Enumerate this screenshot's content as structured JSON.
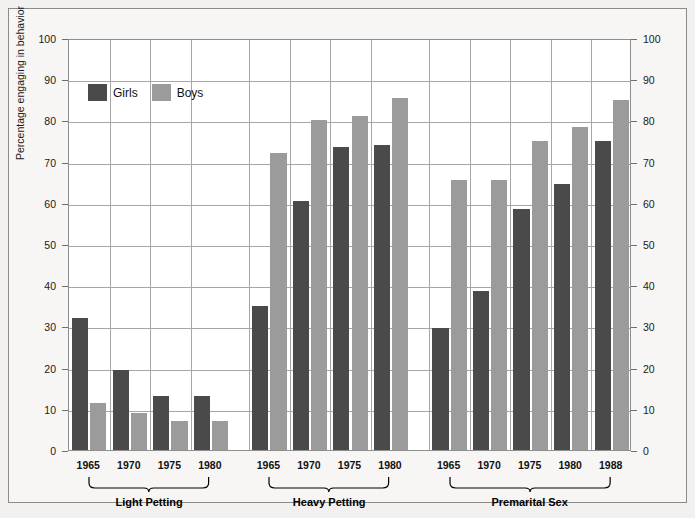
{
  "chart_data": {
    "type": "bar",
    "title": "",
    "subtitle": "",
    "xlabel": "",
    "ylabel": "Percentage engaging in behavior",
    "ylim": [
      0,
      100
    ],
    "ytick_values": [
      0,
      10,
      20,
      30,
      40,
      50,
      60,
      70,
      80,
      90,
      100
    ],
    "ytick_labels": [
      "0",
      "10",
      "20",
      "30",
      "40",
      "50",
      "60",
      "70",
      "80",
      "90",
      "100"
    ],
    "right_axis": true,
    "right_ytick_labels": [
      "0",
      "10",
      "20",
      "30",
      "40",
      "50",
      "60",
      "70",
      "80",
      "90",
      "100"
    ],
    "grid": true,
    "legend_position": "upper-left-inside",
    "legend": [
      {
        "name": "Girls",
        "color": "#4a4a4a"
      },
      {
        "name": "Boys",
        "color": "#9b9b9b"
      }
    ],
    "groups": [
      {
        "label": "Light Petting",
        "categories": [
          "1965",
          "1970",
          "1975",
          "1980"
        ],
        "series": [
          {
            "name": "Girls",
            "values": [
              32,
              19.5,
              13,
              13
            ]
          },
          {
            "name": "Boys",
            "values": [
              11.5,
              9,
              7,
              7
            ]
          }
        ]
      },
      {
        "label": "Heavy Petting",
        "categories": [
          "1965",
          "1970",
          "1975",
          "1980"
        ],
        "series": [
          {
            "name": "Girls",
            "values": [
              35,
              60.5,
              73.5,
              74
            ]
          },
          {
            "name": "Boys",
            "values": [
              72,
              80,
              81,
              85.5
            ]
          }
        ]
      },
      {
        "label": "Premarital Sex",
        "categories": [
          "1965",
          "1970",
          "1975",
          "1980",
          "1988"
        ],
        "series": [
          {
            "name": "Girls",
            "values": [
              29.5,
              38.5,
              58.5,
              64.5,
              75
            ]
          },
          {
            "name": "Boys",
            "values": [
              65.5,
              65.5,
              75,
              78.5,
              85
            ]
          }
        ]
      }
    ]
  }
}
